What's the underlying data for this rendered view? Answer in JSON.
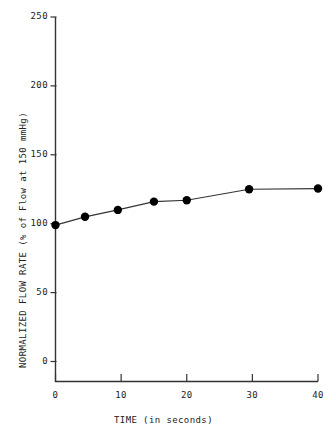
{
  "chart_data": {
    "type": "line",
    "title": "",
    "xlabel": "TIME (in seconds)",
    "ylabel": "NORMALIZED FLOW RATE (% of Flow at 150 mmHg)",
    "xlim": [
      0,
      40
    ],
    "ylim": [
      0,
      250
    ],
    "xticks": [
      0,
      10,
      20,
      30,
      40
    ],
    "yticks": [
      0,
      50,
      100,
      150,
      200,
      250
    ],
    "xtick_labels": [
      "0",
      "10",
      "20",
      "30",
      "40"
    ],
    "ytick_labels": [
      "0",
      "50",
      "100",
      "150",
      "200",
      "250"
    ],
    "grid": false,
    "legend": null,
    "marker": "filled-circle",
    "marker_color": "#000000",
    "line_color": "#333333",
    "series": [
      {
        "name": "Normalized flow rate",
        "x": [
          0,
          4.5,
          9.5,
          15,
          20,
          29.5,
          40
        ],
        "values": [
          99,
          105,
          110,
          116,
          117,
          125,
          125.5
        ]
      }
    ]
  }
}
